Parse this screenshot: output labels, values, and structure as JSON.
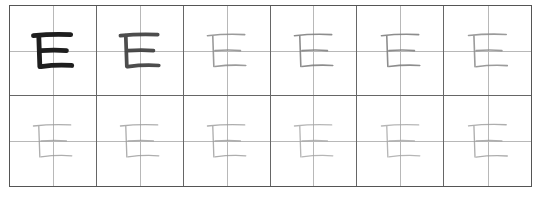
{
  "sheet": {
    "title": "",
    "character": "巨",
    "rows": 2,
    "cols": 6,
    "cells": [
      {
        "stroke": "#1e1e1e",
        "width": 9,
        "opacity": 1.0
      },
      {
        "stroke": "#3a3a3a",
        "width": 7,
        "opacity": 0.9
      },
      {
        "stroke": "#8a8a8a",
        "width": 3,
        "opacity": 0.85
      },
      {
        "stroke": "#7a7a7a",
        "width": 3,
        "opacity": 0.85
      },
      {
        "stroke": "#7a7a7a",
        "width": 3,
        "opacity": 0.85
      },
      {
        "stroke": "#8a8a8a",
        "width": 3,
        "opacity": 0.85
      },
      {
        "stroke": "#9a9a9a",
        "width": 2.5,
        "opacity": 0.8
      },
      {
        "stroke": "#9a9a9a",
        "width": 2.5,
        "opacity": 0.8
      },
      {
        "stroke": "#9a9a9a",
        "width": 2.5,
        "opacity": 0.8
      },
      {
        "stroke": "#a5a5a5",
        "width": 2.5,
        "opacity": 0.8
      },
      {
        "stroke": "#a5a5a5",
        "width": 2.5,
        "opacity": 0.8
      },
      {
        "stroke": "#9a9a9a",
        "width": 2.5,
        "opacity": 0.8
      }
    ]
  }
}
